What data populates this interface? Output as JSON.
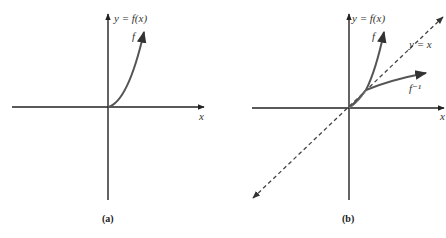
{
  "panels": [
    {
      "id": "a",
      "caption": "(a)",
      "y_axis_label": "y = f(x)",
      "x_axis_label": "x",
      "curve_labels": [
        "f"
      ]
    },
    {
      "id": "b",
      "caption": "(b)",
      "y_axis_label": "y = f(x)",
      "x_axis_label": "x",
      "curve_labels": [
        "f",
        "f⁻¹"
      ],
      "line_label": "y = x"
    }
  ],
  "colors": {
    "axis": "#222222",
    "curve": "#555555",
    "dashed": "#444444"
  }
}
